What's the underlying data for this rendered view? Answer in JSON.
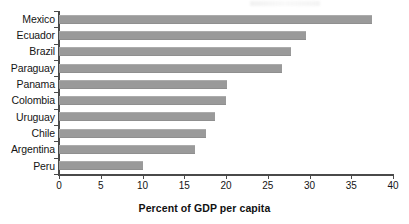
{
  "chart_data": {
    "type": "bar",
    "orientation": "horizontal",
    "title": "",
    "xlabel": "Percent of GDP per capita",
    "ylabel": "",
    "xlim": [
      0,
      40
    ],
    "xticks": [
      0,
      5,
      10,
      15,
      20,
      25,
      30,
      35,
      40
    ],
    "xtick_labels": [
      "0",
      "5",
      "10",
      "15",
      "20",
      "25",
      "30",
      "35",
      "40"
    ],
    "grid": false,
    "legend": null,
    "bar_color": "#9a9a9a",
    "axis_color": "#4a4a4a",
    "text_color": "#141414",
    "categories": [
      "Mexico",
      "Ecuador",
      "Brazil",
      "Paraguay",
      "Panama",
      "Colombia",
      "Uruguay",
      "Chile",
      "Argentina",
      "Peru"
    ],
    "values": [
      37.5,
      29.6,
      27.8,
      26.7,
      20.1,
      20.0,
      18.7,
      17.6,
      16.3,
      10.0
    ]
  }
}
